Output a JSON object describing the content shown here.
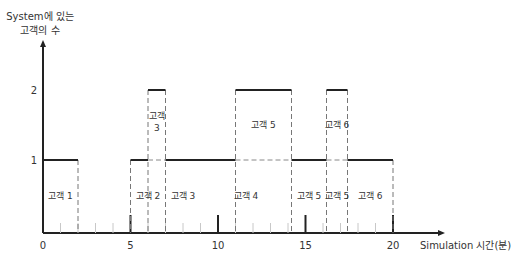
{
  "chart_data": {
    "type": "line",
    "subtype": "step",
    "title": "",
    "ylabel_line1": "System에 있는",
    "ylabel_line2": "고객의 수",
    "xlabel": "Simulation 시간(분)",
    "xlim": [
      0,
      20
    ],
    "ylim": [
      0,
      2
    ],
    "x_ticks": [
      0,
      5,
      10,
      15,
      20
    ],
    "x_tick_labels": [
      "0",
      "5",
      "10",
      "15",
      "20"
    ],
    "y_ticks": [
      1,
      2
    ],
    "y_tick_labels": [
      "1",
      "2"
    ],
    "minor_x_ticks_every": 1,
    "grid": false,
    "legend": null,
    "series": [
      {
        "name": "System에 있는 고객의 수",
        "steps": [
          {
            "t0": 0,
            "t1": 2,
            "value": 1
          },
          {
            "t0": 2,
            "t1": 5,
            "value": 0
          },
          {
            "t0": 5,
            "t1": 6,
            "value": 1
          },
          {
            "t0": 6,
            "t1": 7,
            "value": 2
          },
          {
            "t0": 7,
            "t1": 11,
            "value": 1
          },
          {
            "t0": 11,
            "t1": 14.2,
            "value": 2
          },
          {
            "t0": 14.2,
            "t1": 16.2,
            "value": 1
          },
          {
            "t0": 16.2,
            "t1": 17.4,
            "value": 2
          },
          {
            "t0": 17.4,
            "t1": 20,
            "value": 1
          }
        ]
      }
    ],
    "event_lines": [
      2,
      5,
      6,
      7,
      9,
      11,
      14.2,
      16.2,
      17.4,
      20
    ],
    "annotations": [
      {
        "text": "고객 1",
        "t0": 0,
        "t1": 2,
        "level": 0
      },
      {
        "text": "고객 2",
        "t0": 5,
        "t1": 7,
        "level": 0
      },
      {
        "text": "고객 3",
        "t0": 7,
        "t1": 9,
        "level": 0
      },
      {
        "text": "고객 4",
        "t0": 9,
        "t1": 14.2,
        "level": 0
      },
      {
        "text": "고객 5",
        "t0": 14.2,
        "t1": 16.2,
        "level": 0
      },
      {
        "text": "고객 5",
        "t0": 16.2,
        "t1": 17.4,
        "level": 0
      },
      {
        "text": "고객 6",
        "t0": 17.4,
        "t1": 20,
        "level": 0
      },
      {
        "text": "고객 3",
        "t0": 6,
        "t1": 7,
        "level": 1,
        "wrap": true
      },
      {
        "text": "고객 5",
        "t0": 11,
        "t1": 14.2,
        "level": 1
      },
      {
        "text": "고객 6",
        "t0": 16.2,
        "t1": 17.4,
        "level": 1
      }
    ]
  }
}
